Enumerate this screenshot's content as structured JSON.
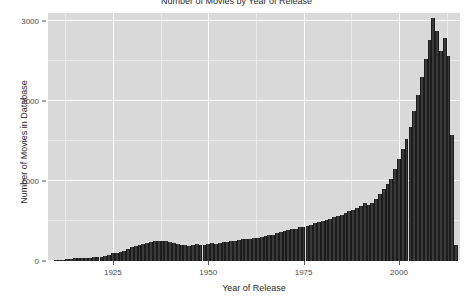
{
  "chart_data": {
    "type": "bar",
    "title": "Number of Movies by Year of Release",
    "xlabel": "Year of Release",
    "ylabel": "Number of Movies in Database",
    "xlim": [
      1908,
      2016
    ],
    "ylim": [
      0,
      3100
    ],
    "grid": true,
    "legend": "none",
    "bar_color": "#3a3a3a",
    "panel_color": "#d9d9d9",
    "gridline_color": "#ffffff",
    "x_ticks": [
      1925,
      1950,
      1975,
      2000
    ],
    "x_tick_labels": [
      "1925",
      "1950",
      "1975",
      "2000"
    ],
    "x_minor_ticks": [
      1912.5,
      1937.5,
      1962.5,
      1987.5,
      2012.5
    ],
    "y_ticks": [
      0,
      1000,
      2000,
      3000
    ],
    "y_tick_labels": [
      "0",
      "1000",
      "2000",
      "3000"
    ],
    "y_minor_ticks": [
      500,
      1500,
      2500
    ],
    "categories": [
      1910,
      1911,
      1912,
      1913,
      1914,
      1915,
      1916,
      1917,
      1918,
      1919,
      1920,
      1921,
      1922,
      1923,
      1924,
      1925,
      1926,
      1927,
      1928,
      1929,
      1930,
      1931,
      1932,
      1933,
      1934,
      1935,
      1936,
      1937,
      1938,
      1939,
      1940,
      1941,
      1942,
      1943,
      1944,
      1945,
      1946,
      1947,
      1948,
      1949,
      1950,
      1951,
      1952,
      1953,
      1954,
      1955,
      1956,
      1957,
      1958,
      1959,
      1960,
      1961,
      1962,
      1963,
      1964,
      1965,
      1966,
      1967,
      1968,
      1969,
      1970,
      1971,
      1972,
      1973,
      1974,
      1975,
      1976,
      1977,
      1978,
      1979,
      1980,
      1981,
      1982,
      1983,
      1984,
      1985,
      1986,
      1987,
      1988,
      1989,
      1990,
      1991,
      1992,
      1993,
      1994,
      1995,
      1996,
      1997,
      1998,
      1999,
      2000,
      2001,
      2002,
      2003,
      2004,
      2005,
      2006,
      2007,
      2008,
      2009,
      2010,
      2011,
      2012,
      2013,
      2014,
      2015
    ],
    "values": [
      8,
      10,
      14,
      20,
      28,
      34,
      40,
      38,
      36,
      42,
      48,
      52,
      56,
      60,
      70,
      95,
      105,
      115,
      125,
      150,
      175,
      190,
      205,
      215,
      230,
      240,
      255,
      250,
      245,
      250,
      235,
      225,
      215,
      205,
      200,
      190,
      205,
      210,
      200,
      205,
      215,
      220,
      215,
      225,
      235,
      240,
      250,
      255,
      265,
      270,
      275,
      280,
      285,
      290,
      300,
      310,
      320,
      330,
      345,
      360,
      370,
      385,
      395,
      405,
      420,
      430,
      440,
      455,
      470,
      485,
      500,
      515,
      530,
      545,
      560,
      580,
      600,
      620,
      640,
      660,
      690,
      720,
      700,
      730,
      780,
      840,
      900,
      960,
      1020,
      1150,
      1280,
      1400,
      1520,
      1680,
      1870,
      2080,
      2300,
      2520,
      2760,
      3040,
      2880,
      2620,
      2790,
      2560,
      1580,
      200
    ]
  }
}
